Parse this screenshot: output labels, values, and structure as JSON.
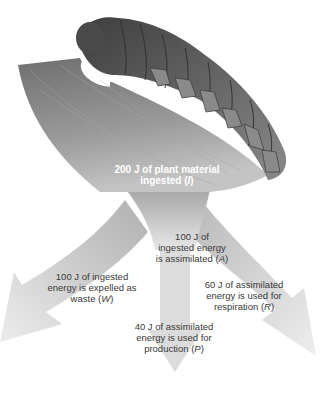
{
  "diagram": {
    "source": {
      "text": "200 J of plant material ingested",
      "symbol": "I"
    },
    "flows": [
      {
        "id": "assimilated",
        "text_line1": "100 J of",
        "text_line2": "ingested energy",
        "text_line3": "is assimilated",
        "symbol": "A"
      },
      {
        "id": "waste",
        "text_line1": "100 J of ingested",
        "text_line2": "energy is expelled as",
        "text_line3": "waste",
        "symbol": "W"
      },
      {
        "id": "respiration",
        "text_line1": "60 J of assimilated",
        "text_line2": "energy is used for",
        "text_line3": "respiration",
        "symbol": "R"
      },
      {
        "id": "production",
        "text_line1": "40 J of assimilated",
        "text_line2": "energy is used for",
        "text_line3": "production",
        "symbol": "P"
      }
    ],
    "colors": {
      "arrow_dark": "#8a8a8a",
      "arrow_light": "#e6e6e6",
      "leaf": "#8c8c8c",
      "caterpillar": "#6e6e6e",
      "text": "#3a3a3a"
    }
  }
}
